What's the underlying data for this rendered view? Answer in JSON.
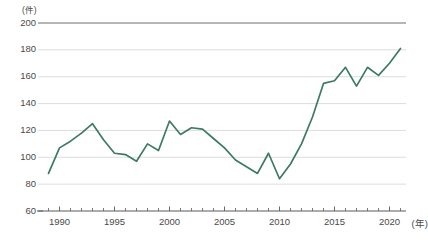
{
  "chart_data": {
    "type": "line",
    "title": "",
    "subtitle": "",
    "xlabel": "(年)",
    "ylabel": "(件)",
    "unit_y": "(件)",
    "unit_x": "(年)",
    "grid": true,
    "legend": "none",
    "series_color": "#3d7a64",
    "ylim": [
      60,
      200
    ],
    "xlim": [
      1988.5,
      2021.5
    ],
    "y_ticks": [
      60,
      80,
      100,
      120,
      140,
      160,
      180,
      200
    ],
    "y_tick_labels": [
      "60",
      "80",
      "100",
      "120",
      "140",
      "160",
      "180",
      "200"
    ],
    "x_ticks": [
      1990,
      1995,
      2000,
      2005,
      2010,
      2015,
      2020
    ],
    "x_tick_labels": [
      "1990",
      "1995",
      "2000",
      "2005",
      "2010",
      "2015",
      "2020"
    ],
    "x_minor_tick_step": 1,
    "x": [
      1989,
      1990,
      1991,
      1992,
      1993,
      1994,
      1995,
      1996,
      1997,
      1998,
      1999,
      2000,
      2001,
      2002,
      2003,
      2004,
      2005,
      2006,
      2007,
      2008,
      2009,
      2010,
      2011,
      2012,
      2013,
      2014,
      2015,
      2016,
      2017,
      2018,
      2019,
      2020,
      2021
    ],
    "values": [
      88,
      107,
      112,
      118,
      125,
      113,
      103,
      102,
      97,
      110,
      105,
      127,
      117,
      122,
      121,
      114,
      107,
      98,
      93,
      88,
      103,
      84,
      95,
      110,
      130,
      155,
      157,
      167,
      153,
      167,
      161,
      170,
      181
    ],
    "series": [
      {
        "name": "件数",
        "color": "#3d7a64",
        "values": [
          88,
          107,
          112,
          118,
          125,
          113,
          103,
          102,
          97,
          110,
          105,
          127,
          117,
          122,
          121,
          114,
          107,
          98,
          93,
          88,
          103,
          84,
          95,
          110,
          130,
          155,
          157,
          167,
          153,
          167,
          161,
          170,
          181
        ]
      }
    ],
    "annotations": []
  },
  "style": {
    "grid_color": "#d9d9d9",
    "top_rule_color": "#6f6f6f",
    "axis_color": "#5a5a5a",
    "text_color": "#4a4a4a",
    "background": "#ffffff"
  }
}
